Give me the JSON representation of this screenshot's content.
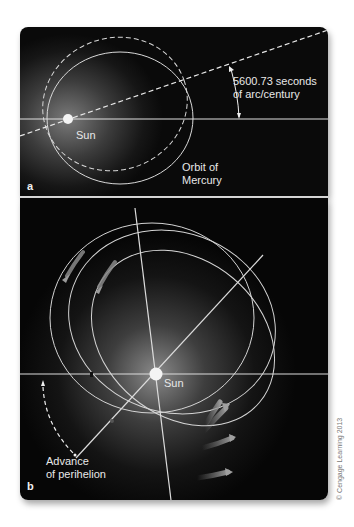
{
  "panel_a": {
    "letter": "a",
    "sun_label": "Sun",
    "angle_label_line1": "5600.73 seconds",
    "angle_label_line2": "of arc/century",
    "orbit_label_line1": "Orbit of",
    "orbit_label_line2": "Mercury"
  },
  "panel_b": {
    "letter": "b",
    "sun_label": "Sun",
    "advance_label_line1": "Advance",
    "advance_label_line2": "of perihelion"
  },
  "credit": "© Cengage Learning 2013",
  "colors": {
    "line": "#d9d9d9",
    "background_dark": "#0a0a0a",
    "sun": "#f4f4f4"
  }
}
